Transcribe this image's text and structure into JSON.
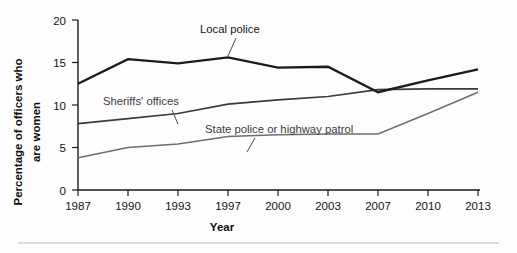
{
  "chart_data": {
    "type": "line",
    "title": "",
    "xlabel": "Year",
    "ylabel": "Percentage of officers who are women",
    "categories": [
      "1987",
      "1990",
      "1993",
      "1997",
      "2000",
      "2003",
      "2007",
      "2010",
      "2013"
    ],
    "x": [
      1987,
      1990,
      1993,
      1997,
      2000,
      2003,
      2007,
      2010,
      2013
    ],
    "xlim": [
      1987,
      2013
    ],
    "ylim": [
      0,
      20
    ],
    "yticks": [
      0,
      5,
      10,
      15,
      20
    ],
    "ytick_labels": [
      "0",
      "5",
      "10",
      "15",
      "20"
    ],
    "grid": false,
    "legend": "inline-annotations",
    "series": [
      {
        "name": "Local police",
        "values": [
          12.5,
          15.4,
          14.9,
          15.6,
          14.4,
          14.5,
          11.5,
          12.9,
          14.2
        ],
        "color": "#1b1b1b"
      },
      {
        "name": "Sheriffs' offices",
        "values": [
          7.8,
          8.4,
          9.0,
          10.1,
          10.6,
          11.0,
          11.8,
          11.9,
          11.9
        ],
        "color": "#3a3a3a"
      },
      {
        "name": "State police or highway patrol",
        "values": [
          3.8,
          5.0,
          5.4,
          6.3,
          6.5,
          6.6,
          6.6,
          9.0,
          11.5
        ],
        "color": "#6e6e6e"
      }
    ],
    "annotations": [
      {
        "text": "Local police",
        "series": "Local police"
      },
      {
        "text": "Sheriffs' offices",
        "series": "Sheriffs' offices"
      },
      {
        "text": "State police or highway patrol",
        "series": "State police or highway patrol"
      }
    ]
  },
  "axes": {
    "y_label": "Percentage of officers who",
    "y_label_line2": "are women",
    "x_label": "Year"
  },
  "ticks": {
    "y": [
      "20",
      "15",
      "10",
      "5",
      "0"
    ],
    "x": [
      "1987",
      "1990",
      "1993",
      "1997",
      "2000",
      "2003",
      "2007",
      "2010",
      "2013"
    ]
  },
  "labels": {
    "local_police": "Local police",
    "sheriffs_offices": "Sheriffs' offices",
    "state_police": "State police or highway patrol"
  }
}
